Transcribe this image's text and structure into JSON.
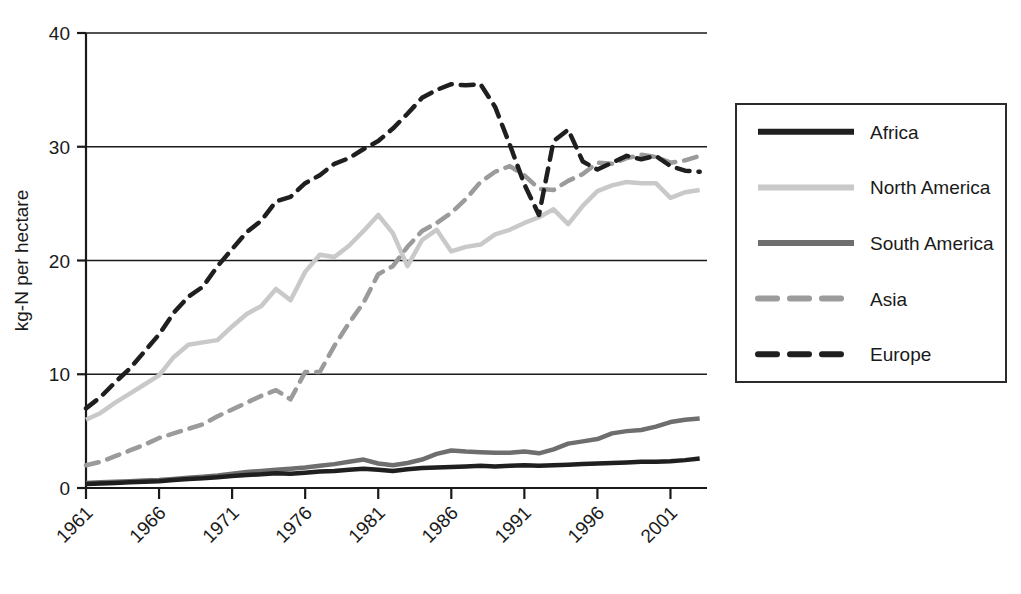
{
  "chart_data": {
    "type": "line",
    "title": "",
    "xlabel": "",
    "ylabel": "kg-N per hectare",
    "xlim": [
      1961,
      2003.5
    ],
    "ylim": [
      0,
      40
    ],
    "grid": true,
    "grid_axis": "y",
    "legend_position": "right",
    "xticks": [
      "1961",
      "1966",
      "1971",
      "1976",
      "1981",
      "1986",
      "1991",
      "1996",
      "2001"
    ],
    "xtick_values": [
      1961,
      1966,
      1971,
      1976,
      1981,
      1986,
      1991,
      1996,
      2001
    ],
    "yticks": [
      "0",
      "10",
      "20",
      "30",
      "40"
    ],
    "ytick_values": [
      0,
      10,
      20,
      30,
      40
    ],
    "x": [
      1961,
      1962,
      1963,
      1964,
      1965,
      1966,
      1967,
      1968,
      1969,
      1970,
      1971,
      1972,
      1973,
      1974,
      1975,
      1976,
      1977,
      1978,
      1979,
      1980,
      1981,
      1982,
      1983,
      1984,
      1985,
      1986,
      1987,
      1988,
      1989,
      1990,
      1991,
      1992,
      1993,
      1994,
      1995,
      1996,
      1997,
      1998,
      1999,
      2000,
      2001,
      2002,
      2003
    ],
    "series": [
      {
        "name": "Africa",
        "color": "#1f1f1f",
        "style": "solid",
        "width": 4.5,
        "values": [
          0.35,
          0.4,
          0.45,
          0.5,
          0.55,
          0.6,
          0.7,
          0.8,
          0.85,
          0.95,
          1.05,
          1.15,
          1.2,
          1.3,
          1.25,
          1.35,
          1.45,
          1.5,
          1.6,
          1.7,
          1.6,
          1.5,
          1.65,
          1.75,
          1.8,
          1.85,
          1.9,
          1.95,
          1.9,
          1.95,
          2.0,
          1.95,
          2.0,
          2.05,
          2.1,
          2.15,
          2.2,
          2.25,
          2.3,
          2.3,
          2.35,
          2.45,
          2.6
        ]
      },
      {
        "name": "North America",
        "color": "#c9c9c9",
        "style": "solid",
        "width": 4.5,
        "values": [
          6.0,
          6.6,
          7.5,
          8.3,
          9.1,
          9.9,
          11.5,
          12.6,
          12.8,
          13.0,
          14.2,
          15.3,
          16.0,
          17.5,
          16.5,
          19.0,
          20.5,
          20.3,
          21.3,
          22.6,
          24.0,
          22.4,
          19.5,
          21.8,
          22.7,
          20.8,
          21.2,
          21.4,
          22.3,
          22.7,
          23.3,
          23.8,
          24.5,
          23.2,
          24.8,
          26.1,
          26.6,
          26.9,
          26.8,
          26.8,
          25.5,
          26.0,
          26.2
        ]
      },
      {
        "name": "South America",
        "color": "#6e6e6e",
        "style": "solid",
        "width": 4.5,
        "values": [
          0.45,
          0.5,
          0.55,
          0.6,
          0.65,
          0.7,
          0.8,
          0.9,
          1.0,
          1.1,
          1.25,
          1.4,
          1.5,
          1.6,
          1.7,
          1.8,
          1.95,
          2.1,
          2.3,
          2.5,
          2.15,
          2.0,
          2.2,
          2.5,
          3.0,
          3.3,
          3.2,
          3.15,
          3.1,
          3.1,
          3.2,
          3.05,
          3.4,
          3.9,
          4.1,
          4.3,
          4.8,
          5.0,
          5.1,
          5.4,
          5.8,
          6.0,
          6.1
        ]
      },
      {
        "name": "Asia",
        "color": "#9b9b9b",
        "style": "dashed",
        "width": 4.5,
        "values": [
          2.0,
          2.3,
          2.8,
          3.3,
          3.8,
          4.4,
          4.8,
          5.2,
          5.6,
          6.3,
          6.9,
          7.5,
          8.1,
          8.6,
          7.8,
          10.2,
          10.2,
          12.5,
          14.5,
          16.3,
          18.8,
          19.5,
          21.2,
          22.6,
          23.3,
          24.2,
          25.4,
          26.9,
          27.8,
          28.3,
          27.5,
          26.3,
          26.2,
          27.0,
          27.6,
          28.6,
          28.5,
          29.0,
          29.3,
          29.1,
          28.6,
          28.8,
          29.2
        ]
      },
      {
        "name": "Europe",
        "color": "#1f1f1f",
        "style": "dashed",
        "width": 4.5,
        "values": [
          7.0,
          8.0,
          9.3,
          10.5,
          12.0,
          13.5,
          15.4,
          16.8,
          17.7,
          19.5,
          21.0,
          22.5,
          23.5,
          25.2,
          25.6,
          26.8,
          27.5,
          28.5,
          29.0,
          29.8,
          30.5,
          31.6,
          32.9,
          34.3,
          35.0,
          35.5,
          35.4,
          35.5,
          33.5,
          30.2,
          26.7,
          24.0,
          30.5,
          31.5,
          28.7,
          28.0,
          28.6,
          29.2,
          28.9,
          29.2,
          28.3,
          27.9,
          27.8
        ]
      }
    ]
  }
}
